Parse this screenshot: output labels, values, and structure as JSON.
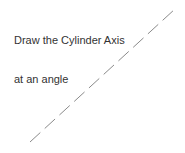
{
  "caption": {
    "line1": "Draw the Cylinder Axis",
    "line2": "at an angle"
  },
  "axis": {
    "x1": 30,
    "y1": 142,
    "x2": 175,
    "y2": 9,
    "color": "#8a8a8a",
    "dash": "14 6"
  }
}
